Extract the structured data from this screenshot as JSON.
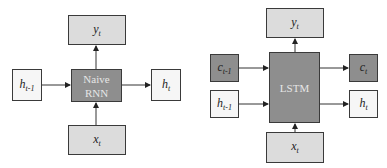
{
  "diagrams": [
    {
      "name": "naive-rnn",
      "core_line1": "Naive",
      "core_line2": "RNN",
      "output": {
        "base": "y",
        "sub": "t"
      },
      "input": {
        "base": "x",
        "sub": "t"
      },
      "hidden_prev": {
        "base": "h",
        "sub": "t-1"
      },
      "hidden_next": {
        "base": "h",
        "sub": "t"
      }
    },
    {
      "name": "lstm",
      "core_label": "LSTM",
      "output": {
        "base": "y",
        "sub": "t"
      },
      "input": {
        "base": "x",
        "sub": "t"
      },
      "cell_prev": {
        "base": "c",
        "sub": "t-1"
      },
      "cell_next": {
        "base": "c",
        "sub": "t"
      },
      "hidden_prev": {
        "base": "h",
        "sub": "t-1"
      },
      "hidden_next": {
        "base": "h",
        "sub": "t"
      }
    }
  ],
  "colors": {
    "light_box": "#dcdcdc",
    "white_box": "#f6f6f6",
    "dark_box": "#8e8e8e",
    "stroke": "#3a3a3a"
  }
}
